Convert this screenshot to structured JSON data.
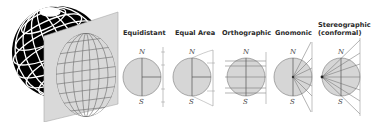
{
  "figure": {
    "globe": {
      "icon": "globe-projection-plane-icon",
      "fill": "#000000",
      "grid": "#ffffff",
      "plane_fill": "#d9d9d9"
    },
    "colors": {
      "disk_fill": "#d6d6d6",
      "line": "#555555",
      "text": "#2a2a2a"
    },
    "projections": [
      {
        "name": "Equidistant",
        "north": "N",
        "south": "S"
      },
      {
        "name": "Equal Area",
        "north": "N",
        "south": "S"
      },
      {
        "name": "Orthographic",
        "north": "N",
        "south": "S"
      },
      {
        "name": "Gnomonic",
        "north": "N",
        "south": "S"
      },
      {
        "name": "Stereographic",
        "subtitle": "(conformal)",
        "north": "N",
        "south": "S"
      }
    ]
  }
}
